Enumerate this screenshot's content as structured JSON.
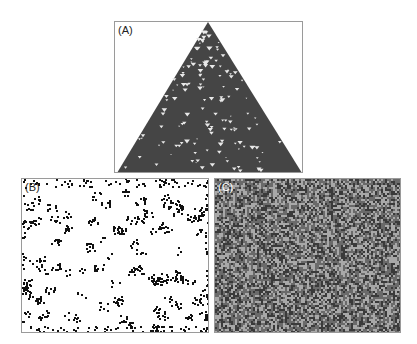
{
  "figure": {
    "panels": [
      {
        "id": "A",
        "label": "(A)",
        "description": "Triangular cellular automaton evolution pattern, dark gray with scattered white triangles",
        "fill": "#454545"
      },
      {
        "id": "B",
        "label": "(B)",
        "description": "Sparse black-on-white cellular automaton state with scattered small clusters",
        "fill": "#ffffff"
      },
      {
        "id": "C",
        "label": "(C)",
        "description": "Dense gray noisy cellular automaton texture",
        "fill": "#6a6a6a"
      }
    ]
  }
}
